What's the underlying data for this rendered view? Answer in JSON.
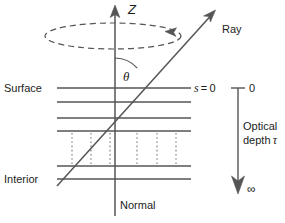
{
  "figure": {
    "type": "scientific-diagram",
    "background_color": "#ffffff",
    "line_color": "#555555",
    "text_color": "#1d1d1d"
  },
  "labels": {
    "z_axis": "Z",
    "ray": "Ray",
    "theta": "θ",
    "surface": "Surface",
    "interior": "Interior",
    "normal": "Normal",
    "s_equals_zero_var": "s",
    "s_equals_zero_rest": " = 0",
    "depth_zero": "0",
    "optical": "Optical",
    "depth_word": "depth ",
    "tau": "τ",
    "infinity": "∞"
  },
  "geometry": {
    "z_axis": {
      "x": 115,
      "y_top": 8,
      "y_bottom": 216
    },
    "ray": {
      "x1": 57,
      "y1": 186,
      "x2": 214,
      "y2": 12
    },
    "ellipse": {
      "cx": 113,
      "cy": 36,
      "rx": 68,
      "ry": 13
    },
    "theta_arc": {
      "cx": 115,
      "cy": 88,
      "radius": 30
    },
    "surface_line_x1": 57,
    "surface_line_x2": 191,
    "horizontal_lines_y": [
      88,
      102,
      118,
      131,
      166,
      179
    ],
    "dotted_columns_x": [
      72,
      91,
      110,
      137,
      157,
      176
    ],
    "dotted_span_y": [
      133,
      164
    ],
    "depth_axis": {
      "x": 238,
      "y_top": 88,
      "y_bottom": 192,
      "tick_half_width": 7
    }
  }
}
